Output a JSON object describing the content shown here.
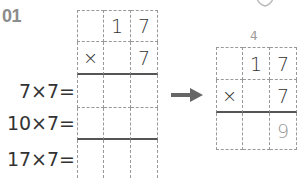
{
  "problem": {
    "number": "01"
  },
  "left_grid": {
    "rows": [
      [
        "",
        "1",
        "7"
      ],
      [
        "×",
        "",
        "7"
      ],
      [
        "",
        "",
        ""
      ],
      [
        "",
        "",
        ""
      ],
      [
        "",
        "",
        ""
      ]
    ]
  },
  "row_labels": [
    "7×7=",
    "10×7=",
    "17×7="
  ],
  "arrow": {
    "icon": "right-arrow-icon",
    "color": "#666666"
  },
  "right_grid": {
    "carry": "4",
    "rows": [
      [
        "",
        "1",
        "7"
      ],
      [
        "×",
        "",
        "7"
      ],
      [
        "",
        "",
        "9"
      ]
    ]
  },
  "mascot": {
    "icon": "character-face-icon"
  }
}
